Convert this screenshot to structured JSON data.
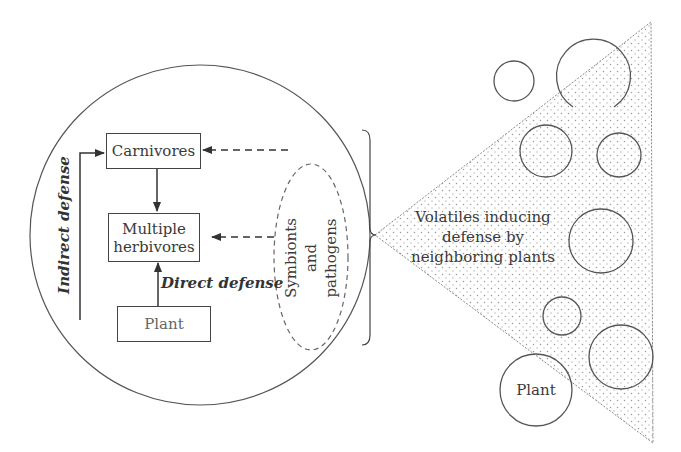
{
  "diagram": {
    "colors": {
      "stroke": "#444444",
      "light_stroke": "#888888",
      "text": "#3a3a3a",
      "dot_fill": "#9a9a9a",
      "background": "#ffffff"
    },
    "nodes": {
      "carnivores": "Carnivores",
      "herbivores_line1": "Multiple",
      "herbivores_line2": "herbivores",
      "plant_focal": "Plant",
      "plant_neighbor": "Plant"
    },
    "labels": {
      "indirect_defense": "Indirect defense",
      "direct_defense": "Direct defense",
      "symbionts_line1": "Symbionts",
      "symbionts_line2": "and",
      "symbionts_line3": "pathogens",
      "volatiles_line1": "Volatiles inducing",
      "volatiles_line2": "defense by",
      "volatiles_line3": "neighboring plants"
    },
    "edges": [
      {
        "from": "carnivores",
        "to": "herbivores",
        "style": "solid"
      },
      {
        "from": "plant",
        "to": "herbivores",
        "style": "solid",
        "label": "Direct defense"
      },
      {
        "from": "plant",
        "to": "carnivores",
        "style": "solid",
        "label": "Indirect defense"
      },
      {
        "from": "symbionts_and_pathogens",
        "to": "carnivores",
        "style": "dashed"
      },
      {
        "from": "symbionts_and_pathogens",
        "to": "herbivores",
        "style": "dashed"
      }
    ],
    "neighbor_circles_count": 9
  }
}
